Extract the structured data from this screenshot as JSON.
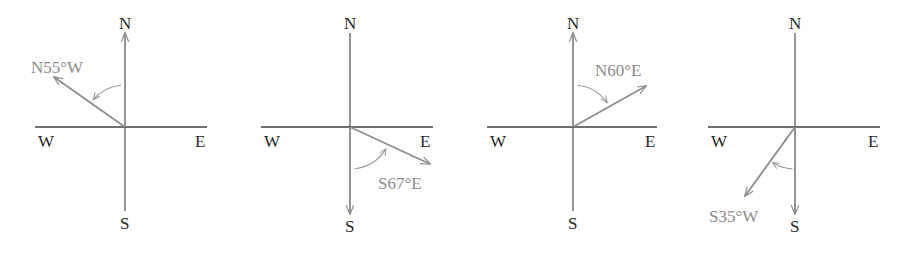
{
  "figure": {
    "type": "compass-bearing-diagrams",
    "background_color": "#ffffff",
    "axis_color": "#3f3f3f",
    "ray_color": "#8f8f8f",
    "label_color": "#262626",
    "bearing_label_color": "#8c8c8c",
    "compass_labels": {
      "north": "N",
      "south": "S",
      "east": "E",
      "west": "W"
    },
    "diagrams": [
      {
        "id": "diagram-1",
        "bearing_text": "N55°W",
        "bearing_from": "N",
        "bearing_angle_deg": 55,
        "bearing_toward": "W",
        "origin": {
          "x": 125,
          "y": 127
        },
        "axis_x": {
          "x1": 35,
          "x2": 207
        },
        "axis_y": {
          "y1": 33,
          "y2": 211
        },
        "highlight_axis": "N",
        "ray_end": {
          "x": 54,
          "y": 77
        },
        "label_pos": {
          "x": 31,
          "y": 73
        },
        "north_label_pos": {
          "x": 119,
          "y": 29
        },
        "south_label_pos": {
          "x": 120,
          "y": 229
        },
        "west_label_pos": {
          "x": 38,
          "y": 147
        },
        "east_label_pos": {
          "x": 195,
          "y": 147
        }
      },
      {
        "id": "diagram-2",
        "bearing_text": "S67°E",
        "bearing_from": "S",
        "bearing_angle_deg": 67,
        "bearing_toward": "E",
        "origin": {
          "x": 350,
          "y": 127
        },
        "axis_x": {
          "x1": 261,
          "x2": 433
        },
        "axis_y": {
          "y1": 33,
          "y2": 214
        },
        "highlight_axis": "S",
        "ray_end": {
          "x": 430,
          "y": 164
        },
        "label_pos": {
          "x": 378,
          "y": 189
        },
        "north_label_pos": {
          "x": 344,
          "y": 29
        },
        "south_label_pos": {
          "x": 345,
          "y": 232
        },
        "west_label_pos": {
          "x": 264,
          "y": 147
        },
        "east_label_pos": {
          "x": 420,
          "y": 147
        }
      },
      {
        "id": "diagram-3",
        "bearing_text": "N60°E",
        "bearing_from": "N",
        "bearing_angle_deg": 60,
        "bearing_toward": "E",
        "origin": {
          "x": 573,
          "y": 127
        },
        "axis_x": {
          "x1": 487,
          "x2": 657
        },
        "axis_y": {
          "y1": 33,
          "y2": 211
        },
        "highlight_axis": "N",
        "ray_end": {
          "x": 646,
          "y": 86
        },
        "label_pos": {
          "x": 595,
          "y": 76
        },
        "north_label_pos": {
          "x": 567,
          "y": 29
        },
        "south_label_pos": {
          "x": 568,
          "y": 229
        },
        "west_label_pos": {
          "x": 490,
          "y": 147
        },
        "east_label_pos": {
          "x": 645,
          "y": 147
        }
      },
      {
        "id": "diagram-4",
        "bearing_text": "S35°W",
        "bearing_from": "S",
        "bearing_angle_deg": 35,
        "bearing_toward": "W",
        "origin": {
          "x": 795,
          "y": 127
        },
        "axis_x": {
          "x1": 708,
          "x2": 880
        },
        "axis_y": {
          "y1": 33,
          "y2": 214
        },
        "highlight_axis": "S",
        "ray_end": {
          "x": 745,
          "y": 196
        },
        "label_pos": {
          "x": 709,
          "y": 222
        },
        "north_label_pos": {
          "x": 789,
          "y": 29
        },
        "south_label_pos": {
          "x": 790,
          "y": 232
        },
        "west_label_pos": {
          "x": 711,
          "y": 147
        },
        "east_label_pos": {
          "x": 868,
          "y": 147
        }
      }
    ]
  }
}
